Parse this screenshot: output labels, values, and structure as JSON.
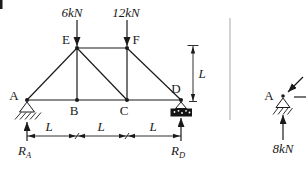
{
  "colors": {
    "ink": "#1a1a1a",
    "background": "#ffffff",
    "divider": "#c9c9c9"
  },
  "truss_figure": {
    "nodes": {
      "A": "A",
      "B": "B",
      "C": "C",
      "D": "D",
      "E": "E",
      "F": "F"
    },
    "members": [
      "AB",
      "BC",
      "CD",
      "EF",
      "AE",
      "EB",
      "EC",
      "FC",
      "FD"
    ],
    "loads": [
      {
        "at": "E",
        "label": "6kN",
        "direction": "down"
      },
      {
        "at": "F",
        "label": "12kN",
        "direction": "down"
      }
    ],
    "supports": [
      {
        "at": "A",
        "type": "pin"
      },
      {
        "at": "D",
        "type": "rocker"
      }
    ],
    "reactions": [
      {
        "symbol": "R",
        "subscript": "A",
        "direction": "up"
      },
      {
        "symbol": "R",
        "subscript": "D",
        "direction": "up"
      }
    ],
    "dimensions": {
      "spans": [
        "L",
        "L",
        "L"
      ],
      "height": "L"
    }
  },
  "joint_fbd": {
    "node": "A",
    "reaction": "8kN",
    "forces": [
      "diagonal-member-force",
      "horizontal-member-force"
    ]
  }
}
